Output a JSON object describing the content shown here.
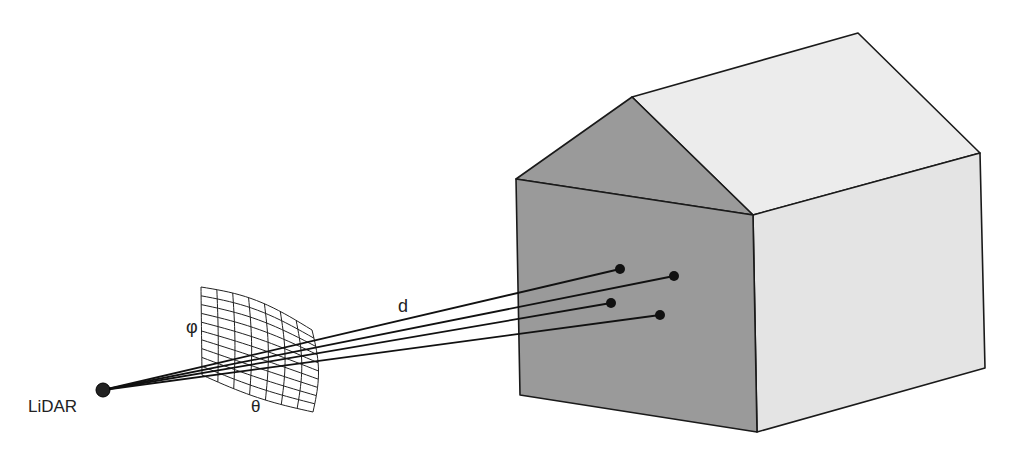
{
  "labels": {
    "sensor": "LiDAR",
    "distance": "d",
    "azimuth": "θ",
    "elevation": "φ"
  },
  "colors": {
    "front_face": "#9a9a9a",
    "gable": "#9a9a9a",
    "side_wall": "#e6e6e6",
    "roof": "#ececec",
    "stroke": "#1a1a1a"
  },
  "sensor": {
    "x": 103,
    "y": 390,
    "r": 7
  },
  "grid": {
    "cols": 7,
    "rows": 10
  },
  "hit_points": [
    {
      "x": 620,
      "y": 269
    },
    {
      "x": 674,
      "y": 276
    },
    {
      "x": 611,
      "y": 303
    },
    {
      "x": 660,
      "y": 315
    }
  ]
}
